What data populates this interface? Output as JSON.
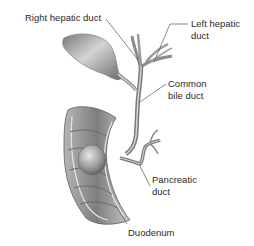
{
  "diagram": {
    "type": "anatomical illustration",
    "labels": {
      "right_hepatic_duct": "Right hepatic duct",
      "left_hepatic_duct": {
        "line1": "Left hepatic",
        "line2": "duct"
      },
      "common_bile_duct": {
        "line1": "Common",
        "line2": "bile duct"
      },
      "pancreatic_duct": {
        "line1": "Pancreatic",
        "line2": "duct"
      },
      "duodenum": "Duodenum"
    },
    "colors": {
      "background": "#ffffff",
      "label_text": "#2a2a2a",
      "leader_line": "#555555",
      "tissue_dark": "#5a5a5a",
      "tissue_mid": "#9a9a9a",
      "tissue_light": "#d8d8d8"
    }
  }
}
